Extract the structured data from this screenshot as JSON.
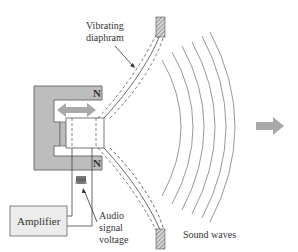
{
  "diagram": {
    "labels": {
      "vibrating_diaphragm_line1": "Vibrating",
      "vibrating_diaphragm_line2": "diaphram",
      "magnet_pole_top": "N",
      "magnet_pole_bottom": "N",
      "amplifier": "Amplifier",
      "audio_signal_line1": "Audio",
      "audio_signal_line2": "signal",
      "audio_signal_line3": "voltage",
      "sound_waves": "Sound waves"
    },
    "colors": {
      "magnet_fill": "#bdbdbd",
      "magnet_stroke": "#707070",
      "arrow_fill": "#a9a9a9",
      "amplifier_fill": "#ececec",
      "wave_stroke": "#8c8c8c",
      "line_stroke": "#444444",
      "label_text": "#333333"
    },
    "sound_wave_count": 6
  }
}
